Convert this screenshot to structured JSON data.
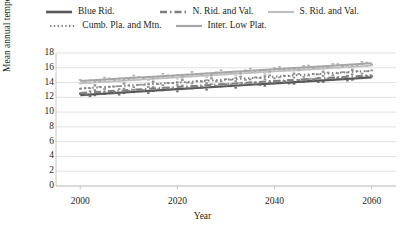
{
  "chart_data": {
    "type": "line",
    "title": "",
    "xlabel": "Year",
    "ylabel": "Mean annual temperature (°C)",
    "xlim": [
      1995,
      2065
    ],
    "ylim": [
      0,
      18
    ],
    "xticks": [
      2000,
      2020,
      2040,
      2060
    ],
    "yticks": [
      0,
      2,
      4,
      6,
      8,
      10,
      12,
      14,
      16,
      18
    ],
    "grid": true,
    "legend_position": "top",
    "x": [
      2000,
      2005,
      2010,
      2015,
      2020,
      2025,
      2030,
      2035,
      2040,
      2045,
      2050,
      2055,
      2060
    ],
    "series": [
      {
        "name": "Blue Rid.",
        "style": "solid",
        "color": "#595959",
        "width": 2.2,
        "values": [
          12.3,
          12.5,
          12.7,
          12.9,
          13.1,
          13.3,
          13.5,
          13.7,
          13.9,
          14.1,
          14.3,
          14.5,
          14.7
        ]
      },
      {
        "name": "N. Rid. and Val.",
        "style": "dashdot",
        "color": "#7f7f7f",
        "width": 2.0,
        "values": [
          12.6,
          12.8,
          13.0,
          13.2,
          13.4,
          13.6,
          13.8,
          14.0,
          14.2,
          14.4,
          14.6,
          14.8,
          15.0
        ]
      },
      {
        "name": "S. Rid. and Val.",
        "style": "solid",
        "color": "#bfbfbf",
        "width": 1.8,
        "values": [
          13.9,
          14.1,
          14.3,
          14.5,
          14.7,
          14.9,
          15.1,
          15.3,
          15.5,
          15.7,
          15.9,
          16.1,
          16.3
        ]
      },
      {
        "name": "Cumb. Pla. and Mtn.",
        "style": "dotted",
        "color": "#808080",
        "width": 2.0,
        "values": [
          13.2,
          13.4,
          13.6,
          13.8,
          14.0,
          14.2,
          14.4,
          14.6,
          14.8,
          15.0,
          15.2,
          15.4,
          15.6
        ]
      },
      {
        "name": "Inter. Low Plat.",
        "style": "solid",
        "color": "#a6a6a6",
        "width": 2.0,
        "values": [
          14.2,
          14.4,
          14.6,
          14.8,
          15.0,
          15.2,
          15.4,
          15.6,
          15.8,
          16.0,
          16.2,
          16.4,
          16.6
        ]
      }
    ]
  },
  "legend": {
    "rows": [
      [
        "Blue Rid.",
        "N. Rid. and Val.",
        "S. Rid. and Val."
      ],
      [
        "Cumb. Pla. and Mtn.",
        "Inter. Low Plat."
      ]
    ]
  }
}
